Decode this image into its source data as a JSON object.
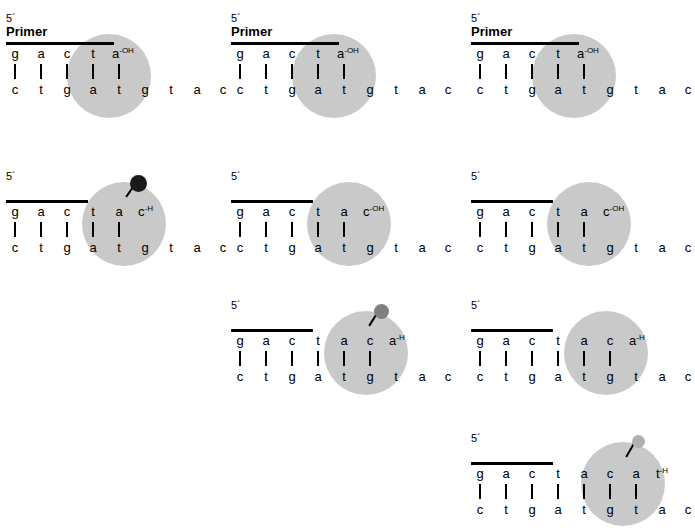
{
  "figure": {
    "background_color": "#ffffff",
    "halo_color": "#c9c9c9",
    "strand_color": "#000000"
  },
  "labels": {
    "five_prime": "5´",
    "primer": "Primer",
    "hydroxyl": "-OH",
    "hydrogen": "-H"
  },
  "panels": [
    {
      "id": "panel-r1c1",
      "row": 1,
      "column": 1,
      "show_primer_word": true,
      "primer_bar_width": 108,
      "top_strand": [
        {
          "base": "g",
          "sup": ""
        },
        {
          "base": "a",
          "sup": ""
        },
        {
          "base": "c",
          "sup": ""
        },
        {
          "base": "t",
          "sup": ""
        },
        {
          "base": "a",
          "sup": "-OH"
        }
      ],
      "bottom_strand": [
        "c",
        "t",
        "g",
        "a",
        "t",
        "g",
        "t",
        "a",
        "c"
      ],
      "bond_count": 5,
      "halo": {
        "left": 63,
        "top": 22,
        "size": 84
      },
      "nucleotide": null
    },
    {
      "id": "panel-r1c2",
      "row": 1,
      "column": 2,
      "show_primer_word": true,
      "primer_bar_width": 108,
      "top_strand": [
        {
          "base": "g",
          "sup": ""
        },
        {
          "base": "a",
          "sup": ""
        },
        {
          "base": "c",
          "sup": ""
        },
        {
          "base": "t",
          "sup": ""
        },
        {
          "base": "a",
          "sup": "-OH"
        }
      ],
      "bottom_strand": [
        "c",
        "t",
        "g",
        "a",
        "t",
        "g",
        "t",
        "a",
        "c"
      ],
      "bond_count": 5,
      "halo": {
        "left": 63,
        "top": 22,
        "size": 84
      },
      "nucleotide": null
    },
    {
      "id": "panel-r1c3",
      "row": 1,
      "column": 3,
      "show_primer_word": true,
      "primer_bar_width": 108,
      "top_strand": [
        {
          "base": "g",
          "sup": ""
        },
        {
          "base": "a",
          "sup": ""
        },
        {
          "base": "c",
          "sup": ""
        },
        {
          "base": "t",
          "sup": ""
        },
        {
          "base": "a",
          "sup": "-OH"
        }
      ],
      "bottom_strand": [
        "c",
        "t",
        "g",
        "a",
        "t",
        "g",
        "t",
        "a",
        "c"
      ],
      "bond_count": 5,
      "halo": {
        "left": 63,
        "top": 22,
        "size": 84
      },
      "nucleotide": null
    },
    {
      "id": "panel-r2c1",
      "row": 2,
      "column": 1,
      "show_primer_word": false,
      "primer_bar_width": 82,
      "top_strand": [
        {
          "base": "g",
          "sup": ""
        },
        {
          "base": "a",
          "sup": ""
        },
        {
          "base": "c",
          "sup": ""
        },
        {
          "base": "t",
          "sup": ""
        },
        {
          "base": "a",
          "sup": ""
        },
        {
          "base": "c",
          "sup": "-H"
        }
      ],
      "bottom_strand": [
        "c",
        "t",
        "g",
        "a",
        "t",
        "g",
        "t",
        "a",
        "c"
      ],
      "bond_count": 5,
      "halo": {
        "left": 78,
        "top": 12,
        "size": 84
      },
      "nucleotide": {
        "color": "#1a1a1a",
        "size": 17,
        "left": 126,
        "top": 5,
        "link_x": 122,
        "link_y": 26,
        "link_len": 17,
        "link_angle": -55
      }
    },
    {
      "id": "panel-r2c2",
      "row": 2,
      "column": 2,
      "show_primer_word": false,
      "primer_bar_width": 82,
      "top_strand": [
        {
          "base": "g",
          "sup": ""
        },
        {
          "base": "a",
          "sup": ""
        },
        {
          "base": "c",
          "sup": ""
        },
        {
          "base": "t",
          "sup": ""
        },
        {
          "base": "a",
          "sup": ""
        },
        {
          "base": "c",
          "sup": "-OH"
        }
      ],
      "bottom_strand": [
        "c",
        "t",
        "g",
        "a",
        "t",
        "g",
        "t",
        "a",
        "c"
      ],
      "bond_count": 5,
      "halo": {
        "left": 78,
        "top": 12,
        "size": 84
      },
      "nucleotide": null
    },
    {
      "id": "panel-r2c3",
      "row": 2,
      "column": 3,
      "show_primer_word": false,
      "primer_bar_width": 82,
      "top_strand": [
        {
          "base": "g",
          "sup": ""
        },
        {
          "base": "a",
          "sup": ""
        },
        {
          "base": "c",
          "sup": ""
        },
        {
          "base": "t",
          "sup": ""
        },
        {
          "base": "a",
          "sup": ""
        },
        {
          "base": "c",
          "sup": "-OH"
        }
      ],
      "bottom_strand": [
        "c",
        "t",
        "g",
        "a",
        "t",
        "g",
        "t",
        "a",
        "c"
      ],
      "bond_count": 5,
      "halo": {
        "left": 78,
        "top": 12,
        "size": 84
      },
      "nucleotide": null
    },
    {
      "id": "panel-r3c2",
      "row": 3,
      "column": 2,
      "show_primer_word": false,
      "primer_bar_width": 82,
      "top_strand": [
        {
          "base": "g",
          "sup": ""
        },
        {
          "base": "a",
          "sup": ""
        },
        {
          "base": "c",
          "sup": ""
        },
        {
          "base": "t",
          "sup": ""
        },
        {
          "base": "a",
          "sup": ""
        },
        {
          "base": "c",
          "sup": ""
        },
        {
          "base": "a",
          "sup": "-H"
        }
      ],
      "bottom_strand": [
        "c",
        "t",
        "g",
        "a",
        "t",
        "g",
        "t",
        "a",
        "c"
      ],
      "bond_count": 6,
      "halo": {
        "left": 95,
        "top": 12,
        "size": 84
      },
      "nucleotide": {
        "color": "#808080",
        "size": 15,
        "left": 145,
        "top": 5,
        "link_x": 140,
        "link_y": 26,
        "link_len": 17,
        "link_angle": -58
      }
    },
    {
      "id": "panel-r3c3",
      "row": 3,
      "column": 3,
      "show_primer_word": false,
      "primer_bar_width": 82,
      "top_strand": [
        {
          "base": "g",
          "sup": ""
        },
        {
          "base": "a",
          "sup": ""
        },
        {
          "base": "c",
          "sup": ""
        },
        {
          "base": "t",
          "sup": ""
        },
        {
          "base": "a",
          "sup": ""
        },
        {
          "base": "c",
          "sup": ""
        },
        {
          "base": "a",
          "sup": "-H"
        }
      ],
      "bottom_strand": [
        "c",
        "t",
        "g",
        "a",
        "t",
        "g",
        "t",
        "a",
        "c"
      ],
      "bond_count": 6,
      "halo": {
        "left": 95,
        "top": 12,
        "size": 84
      },
      "nucleotide": null
    },
    {
      "id": "panel-r4c3",
      "row": 4,
      "column": 3,
      "show_primer_word": false,
      "primer_bar_width": 82,
      "top_strand": [
        {
          "base": "g",
          "sup": ""
        },
        {
          "base": "a",
          "sup": ""
        },
        {
          "base": "c",
          "sup": ""
        },
        {
          "base": "t",
          "sup": ""
        },
        {
          "base": "a",
          "sup": ""
        },
        {
          "base": "c",
          "sup": ""
        },
        {
          "base": "a",
          "sup": ""
        },
        {
          "base": "t",
          "sup": "-H"
        }
      ],
      "bottom_strand": [
        "c",
        "t",
        "g",
        "a",
        "t",
        "g",
        "t",
        "a",
        "c"
      ],
      "bond_count": 7,
      "halo": {
        "left": 112,
        "top": 10,
        "size": 84
      },
      "nucleotide": {
        "color": "#b0b0b0",
        "size": 13,
        "left": 163,
        "top": 3,
        "link_x": 157,
        "link_y": 24,
        "link_len": 17,
        "link_angle": -60
      }
    }
  ],
  "layout": {
    "panel_origins": [
      {
        "id": "panel-r1c1",
        "left": 4,
        "top": 12
      },
      {
        "id": "panel-r1c2",
        "left": 229,
        "top": 12
      },
      {
        "id": "panel-r1c3",
        "left": 469,
        "top": 12
      },
      {
        "id": "panel-r2c1",
        "left": 4,
        "top": 170
      },
      {
        "id": "panel-r2c2",
        "left": 229,
        "top": 170
      },
      {
        "id": "panel-r2c3",
        "left": 469,
        "top": 170
      },
      {
        "id": "panel-r3c2",
        "left": 229,
        "top": 299
      },
      {
        "id": "panel-r3c3",
        "left": 469,
        "top": 299
      },
      {
        "id": "panel-r4c3",
        "left": 469,
        "top": 432
      }
    ],
    "base_spacing": 26,
    "top_strand_y": 34,
    "bond_y": 52,
    "bottom_strand_y": 70,
    "primer_bar_y": 30
  }
}
